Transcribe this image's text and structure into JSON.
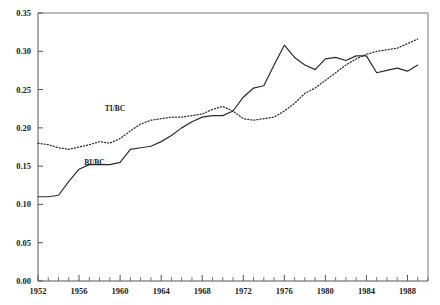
{
  "chart_data": {
    "type": "line",
    "title": "",
    "subtitle": "",
    "xlabel": "",
    "ylabel": "",
    "xlim": [
      1952,
      1990
    ],
    "ylim": [
      0.0,
      0.35
    ],
    "grid": false,
    "legend_position": "inline-annotation",
    "y_ticks": [
      "0.00",
      "0.05",
      "0.10",
      "0.15",
      "0.20",
      "0.25",
      "0.30",
      "0.35"
    ],
    "y_tick_values": [
      0.0,
      0.05,
      0.1,
      0.15,
      0.2,
      0.25,
      0.3,
      0.35
    ],
    "x_ticks": [
      "1952",
      "1956",
      "1960",
      "1964",
      "1968",
      "1972",
      "1976",
      "1980",
      "1984",
      "1988"
    ],
    "x_tick_values": [
      1952,
      1956,
      1960,
      1964,
      1968,
      1972,
      1976,
      1980,
      1984,
      1988
    ],
    "x_minor_step": 1,
    "annotations": [
      {
        "text": "TI/BC",
        "x": 1959.5,
        "y": 0.222
      },
      {
        "text": "BI/BC",
        "x": 1957.5,
        "y": 0.152
      }
    ],
    "x": [
      1952,
      1953,
      1954,
      1955,
      1956,
      1957,
      1958,
      1959,
      1960,
      1961,
      1962,
      1963,
      1964,
      1965,
      1966,
      1967,
      1968,
      1969,
      1970,
      1971,
      1972,
      1973,
      1974,
      1975,
      1976,
      1977,
      1978,
      1979,
      1980,
      1981,
      1982,
      1983,
      1984,
      1985,
      1986,
      1987,
      1988,
      1989
    ],
    "series": [
      {
        "name": "TI/BC",
        "style": "dotted",
        "values": [
          0.18,
          0.178,
          0.174,
          0.172,
          0.175,
          0.178,
          0.182,
          0.18,
          0.186,
          0.196,
          0.205,
          0.21,
          0.212,
          0.214,
          0.214,
          0.216,
          0.218,
          0.224,
          0.228,
          0.222,
          0.212,
          0.21,
          0.212,
          0.214,
          0.222,
          0.232,
          0.245,
          0.252,
          0.262,
          0.272,
          0.282,
          0.29,
          0.296,
          0.3,
          0.302,
          0.304,
          0.31,
          0.316
        ]
      },
      {
        "name": "BI/BC",
        "style": "solid",
        "values": [
          0.11,
          0.11,
          0.112,
          0.13,
          0.146,
          0.152,
          0.152,
          0.152,
          0.155,
          0.172,
          0.174,
          0.176,
          0.182,
          0.19,
          0.2,
          0.208,
          0.214,
          0.216,
          0.216,
          0.222,
          0.24,
          0.252,
          0.255,
          0.282,
          0.308,
          0.292,
          0.282,
          0.276,
          0.29,
          0.292,
          0.288,
          0.294,
          0.294,
          0.272,
          0.275,
          0.278,
          0.274,
          0.282
        ]
      }
    ]
  }
}
